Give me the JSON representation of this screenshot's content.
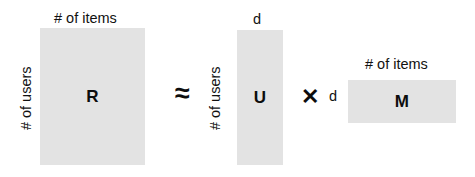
{
  "diagram": {
    "fill_color": "#e3e3e3",
    "text_color": "#111111",
    "background_color": "#ffffff",
    "matrices": [
      {
        "id": "R",
        "letter": "R",
        "column_label": "# of items",
        "row_label": "# of users"
      },
      {
        "id": "U",
        "letter": "U",
        "column_label": "d",
        "row_label": "# of users"
      },
      {
        "id": "M",
        "letter": "M",
        "column_label": "# of items",
        "row_label": "d"
      }
    ],
    "operators": {
      "approx": "≈",
      "times": "✕"
    }
  }
}
